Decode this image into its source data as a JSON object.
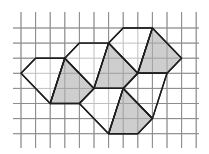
{
  "diagram": {
    "type": "grid-tiling",
    "grid": {
      "origin_x": 21,
      "origin_y": 28,
      "step_x": 14.6,
      "step_y": 15.1,
      "columns": 13,
      "rows": 8,
      "v_extent": [
        12,
        148
      ],
      "h_extent": [
        13,
        199
      ],
      "line_color": "#8c8c8c"
    },
    "colors": {
      "edge": "#1e1e1e",
      "shaded": "#c6c6c6",
      "white": "#ffffff"
    },
    "hexagons": [
      {
        "name": "hexagon-left",
        "white_part": [
          [
            0,
            3
          ],
          [
            1,
            2
          ],
          [
            3,
            2
          ],
          [
            2,
            5
          ]
        ],
        "shaded_part": [
          [
            3,
            2
          ],
          [
            5,
            4
          ],
          [
            4,
            5
          ],
          [
            2,
            5
          ]
        ]
      },
      {
        "name": "hexagon-middle",
        "white_part": [
          [
            3,
            2
          ],
          [
            4,
            1
          ],
          [
            6,
            1
          ],
          [
            5,
            4
          ]
        ],
        "shaded_part": [
          [
            6,
            1
          ],
          [
            8,
            3
          ],
          [
            7,
            4
          ],
          [
            5,
            4
          ]
        ]
      },
      {
        "name": "hexagon-top-right",
        "white_part": [
          [
            6,
            1
          ],
          [
            7,
            0
          ],
          [
            9,
            0
          ],
          [
            8,
            3
          ]
        ],
        "shaded_part": [
          [
            9,
            0
          ],
          [
            11,
            2
          ],
          [
            10,
            3
          ],
          [
            8,
            3
          ]
        ]
      },
      {
        "name": "hexagon-bottom",
        "white_part": [
          [
            4,
            5
          ],
          [
            5,
            4
          ],
          [
            7,
            4
          ],
          [
            6,
            7
          ]
        ],
        "shaded_part": [
          [
            7,
            4
          ],
          [
            9,
            6
          ],
          [
            8,
            7
          ],
          [
            6,
            7
          ]
        ]
      }
    ],
    "extra_quads": [
      {
        "name": "white-quad-right",
        "points": [
          [
            7,
            4
          ],
          [
            8,
            3
          ],
          [
            10,
            3
          ],
          [
            9,
            6
          ]
        ]
      }
    ]
  }
}
